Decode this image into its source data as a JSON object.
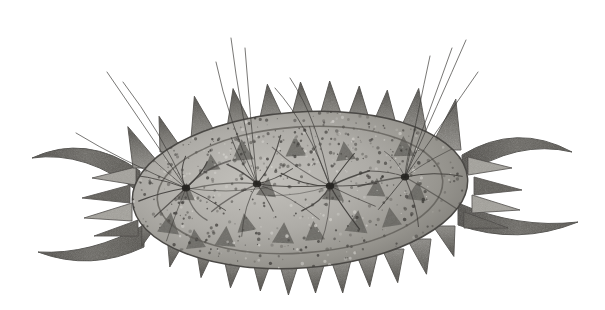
{
  "figure": {
    "domain": "Natural-Image",
    "kind": "scientific-illustration",
    "subject_label": "spiny ostracod-like microorganism, dorsal view",
    "medium": "grayscale halftone engraving / stippled lithograph",
    "caption": "",
    "background_color": "#ffffff",
    "canvas": {
      "width": 605,
      "height": 310
    }
  },
  "palette": {
    "background": "#ffffff",
    "body_light": "#b9b7b2",
    "body_mid": "#9a9892",
    "body_dark": "#6e6c67",
    "marking_dark": "#5a5853",
    "spine_light": "#a3a19b",
    "spine_dark": "#55534e",
    "horn_dark": "#5f5d58",
    "outline": "#4a4845",
    "seta_line": "#3d3b38",
    "speckle_dark": "#3a3835",
    "speckle_light": "#d6d4cf"
  },
  "body": {
    "name": "carapace",
    "shape": "ellipse",
    "center_x": 300,
    "center_y": 190,
    "radius_x": 168,
    "radius_y": 78,
    "rotation_deg": -4,
    "inner_ellipse": {
      "center_x": 300,
      "center_y": 190,
      "radius_x": 143,
      "radius_y": 63,
      "rotation_deg": -4,
      "stroke": "#5d5b56"
    }
  },
  "dorsal_spines": {
    "count": 11,
    "description": "triangular spines along the upper margin, tips pointing up and slightly left",
    "spines": [
      {
        "base_x": 148,
        "base_y": 168,
        "height": 46,
        "half_width": 15,
        "lean_deg": -26,
        "tone": "dark"
      },
      {
        "base_x": 172,
        "base_y": 152,
        "height": 38,
        "half_width": 12,
        "lean_deg": -20,
        "tone": "mid"
      },
      {
        "base_x": 205,
        "base_y": 139,
        "height": 44,
        "half_width": 14,
        "lean_deg": -14,
        "tone": "dark"
      },
      {
        "base_x": 240,
        "base_y": 128,
        "height": 40,
        "half_width": 13,
        "lean_deg": -10,
        "tone": "mid"
      },
      {
        "base_x": 272,
        "base_y": 122,
        "height": 38,
        "half_width": 13,
        "lean_deg": -7,
        "tone": "dark"
      },
      {
        "base_x": 303,
        "base_y": 118,
        "height": 36,
        "half_width": 12,
        "lean_deg": -4,
        "tone": "mid"
      },
      {
        "base_x": 331,
        "base_y": 119,
        "height": 38,
        "half_width": 12,
        "lean_deg": -2,
        "tone": "dark"
      },
      {
        "base_x": 358,
        "base_y": 122,
        "height": 36,
        "half_width": 12,
        "lean_deg": 2,
        "tone": "mid"
      },
      {
        "base_x": 384,
        "base_y": 128,
        "height": 38,
        "half_width": 13,
        "lean_deg": 5,
        "tone": "dark"
      },
      {
        "base_x": 412,
        "base_y": 136,
        "height": 48,
        "half_width": 15,
        "lean_deg": 8,
        "tone": "darker"
      },
      {
        "base_x": 445,
        "base_y": 150,
        "height": 52,
        "half_width": 16,
        "lean_deg": 12,
        "tone": "darker"
      }
    ]
  },
  "ventral_spines": {
    "count": 12,
    "description": "shorter triangular spines along the lower margin, tips pointing down",
    "spines": [
      {
        "base_x": 152,
        "base_y": 218,
        "height": 30,
        "half_width": 10,
        "lean_deg": 20,
        "tone": "mid"
      },
      {
        "base_x": 178,
        "base_y": 234,
        "height": 34,
        "half_width": 11,
        "lean_deg": 14,
        "tone": "dark"
      },
      {
        "base_x": 206,
        "base_y": 246,
        "height": 32,
        "half_width": 10,
        "lean_deg": 9,
        "tone": "mid"
      },
      {
        "base_x": 234,
        "base_y": 254,
        "height": 34,
        "half_width": 11,
        "lean_deg": 6,
        "tone": "dark"
      },
      {
        "base_x": 262,
        "base_y": 259,
        "height": 32,
        "half_width": 10,
        "lean_deg": 3,
        "tone": "mid"
      },
      {
        "base_x": 289,
        "base_y": 262,
        "height": 33,
        "half_width": 10,
        "lean_deg": 1,
        "tone": "dark"
      },
      {
        "base_x": 315,
        "base_y": 262,
        "height": 31,
        "half_width": 10,
        "lean_deg": -1,
        "tone": "mid"
      },
      {
        "base_x": 341,
        "base_y": 260,
        "height": 33,
        "half_width": 10,
        "lean_deg": -3,
        "tone": "dark"
      },
      {
        "base_x": 367,
        "base_y": 256,
        "height": 31,
        "half_width": 10,
        "lean_deg": -5,
        "tone": "mid"
      },
      {
        "base_x": 393,
        "base_y": 249,
        "height": 34,
        "half_width": 11,
        "lean_deg": -8,
        "tone": "dark"
      },
      {
        "base_x": 419,
        "base_y": 239,
        "height": 36,
        "half_width": 12,
        "lean_deg": -12,
        "tone": "darker"
      },
      {
        "base_x": 444,
        "base_y": 226,
        "height": 32,
        "half_width": 11,
        "lean_deg": -18,
        "tone": "dark"
      }
    ]
  },
  "lateral_spines": {
    "left": [
      {
        "tip_x": 92,
        "tip_y": 178,
        "base_x": 136,
        "base_y": 176,
        "half_width": 9
      },
      {
        "tip_x": 82,
        "tip_y": 198,
        "base_x": 130,
        "base_y": 194,
        "half_width": 9
      },
      {
        "tip_x": 84,
        "tip_y": 218,
        "base_x": 132,
        "base_y": 212,
        "half_width": 9
      },
      {
        "tip_x": 94,
        "tip_y": 236,
        "base_x": 138,
        "base_y": 228,
        "half_width": 8
      }
    ],
    "right": [
      {
        "tip_x": 512,
        "tip_y": 168,
        "base_x": 468,
        "base_y": 166,
        "half_width": 9
      },
      {
        "tip_x": 522,
        "tip_y": 190,
        "base_x": 474,
        "base_y": 186,
        "half_width": 9
      },
      {
        "tip_x": 520,
        "tip_y": 210,
        "base_x": 472,
        "base_y": 204,
        "half_width": 9
      },
      {
        "tip_x": 508,
        "tip_y": 228,
        "base_x": 464,
        "base_y": 220,
        "half_width": 8
      }
    ]
  },
  "horns": [
    {
      "id": "horn-upper-left",
      "side": "left",
      "description": "long scythe-shaped process curving up and to the left",
      "tip_x": 32,
      "tip_y": 158,
      "root_x": 140,
      "root_y": 182
    },
    {
      "id": "horn-lower-left",
      "side": "left",
      "description": "long blunt process extending left and slightly down",
      "tip_x": 38,
      "tip_y": 252,
      "root_x": 144,
      "root_y": 236
    },
    {
      "id": "horn-upper-right",
      "side": "right",
      "description": "long process extending right and curving slightly up",
      "tip_x": 572,
      "tip_y": 152,
      "root_x": 462,
      "root_y": 166
    },
    {
      "id": "horn-lower-right",
      "side": "right",
      "description": "long process curving down and then out to the right",
      "tip_x": 578,
      "tip_y": 222,
      "root_x": 458,
      "root_y": 214
    }
  ],
  "seta_hubs": [
    {
      "id": "hub-1",
      "x": 186,
      "y": 188,
      "ray_count": 11,
      "ray_length": 72
    },
    {
      "id": "hub-2",
      "x": 257,
      "y": 184,
      "ray_count": 10,
      "ray_length": 66
    },
    {
      "id": "hub-3",
      "x": 330,
      "y": 186,
      "ray_count": 11,
      "ray_length": 70
    },
    {
      "id": "hub-4",
      "x": 405,
      "y": 177,
      "ray_count": 9,
      "ray_length": 62
    }
  ],
  "long_setae": {
    "count": 12,
    "description": "long fine curved hair-like bristles projecting above the dorsal margin",
    "strands": [
      {
        "x1": 186,
        "y1": 188,
        "cx": 140,
        "cy": 120,
        "x2": 107,
        "y2": 72
      },
      {
        "x1": 186,
        "y1": 188,
        "cx": 160,
        "cy": 130,
        "x2": 123,
        "y2": 82
      },
      {
        "x1": 186,
        "y1": 188,
        "cx": 120,
        "cy": 160,
        "x2": 76,
        "y2": 133
      },
      {
        "x1": 257,
        "y1": 184,
        "cx": 240,
        "cy": 110,
        "x2": 231,
        "y2": 38
      },
      {
        "x1": 257,
        "y1": 184,
        "cx": 250,
        "cy": 115,
        "x2": 245,
        "y2": 48
      },
      {
        "x1": 257,
        "y1": 184,
        "cx": 228,
        "cy": 120,
        "x2": 216,
        "y2": 62
      },
      {
        "x1": 330,
        "y1": 186,
        "cx": 318,
        "cy": 120,
        "x2": 290,
        "y2": 78
      },
      {
        "x1": 330,
        "y1": 186,
        "cx": 308,
        "cy": 125,
        "x2": 275,
        "y2": 88
      },
      {
        "x1": 405,
        "y1": 177,
        "cx": 430,
        "cy": 110,
        "x2": 452,
        "y2": 48
      },
      {
        "x1": 405,
        "y1": 177,
        "cx": 418,
        "cy": 112,
        "x2": 430,
        "y2": 56
      },
      {
        "x1": 405,
        "y1": 177,
        "cx": 446,
        "cy": 118,
        "x2": 478,
        "y2": 72
      },
      {
        "x1": 405,
        "y1": 177,
        "cx": 438,
        "cy": 104,
        "x2": 466,
        "y2": 40
      }
    ]
  },
  "surface_markings": {
    "description": "dark triangular pigment patches scattered over the carapace",
    "triangles": [
      {
        "x": 168,
        "y": 233,
        "size": 22,
        "rot": 8
      },
      {
        "x": 196,
        "y": 248,
        "size": 20,
        "rot": -6
      },
      {
        "x": 225,
        "y": 246,
        "size": 21,
        "rot": 4
      },
      {
        "x": 247,
        "y": 231,
        "size": 19,
        "rot": -10
      },
      {
        "x": 283,
        "y": 243,
        "size": 22,
        "rot": 3
      },
      {
        "x": 315,
        "y": 240,
        "size": 20,
        "rot": -5
      },
      {
        "x": 356,
        "y": 232,
        "size": 23,
        "rot": 6
      },
      {
        "x": 392,
        "y": 226,
        "size": 20,
        "rot": -8
      },
      {
        "x": 186,
        "y": 200,
        "size": 18,
        "rot": 2
      },
      {
        "x": 243,
        "y": 160,
        "size": 22,
        "rot": -4
      },
      {
        "x": 266,
        "y": 196,
        "size": 20,
        "rot": 7
      },
      {
        "x": 296,
        "y": 156,
        "size": 21,
        "rot": -3
      },
      {
        "x": 333,
        "y": 200,
        "size": 22,
        "rot": 5
      },
      {
        "x": 346,
        "y": 160,
        "size": 20,
        "rot": -7
      },
      {
        "x": 376,
        "y": 196,
        "size": 19,
        "rot": 3
      },
      {
        "x": 404,
        "y": 156,
        "size": 21,
        "rot": -2
      },
      {
        "x": 416,
        "y": 200,
        "size": 20,
        "rot": 6
      },
      {
        "x": 212,
        "y": 170,
        "size": 17,
        "rot": -5
      }
    ]
  },
  "texture": {
    "speckle_count": 900,
    "description": "dense stipple / halftone speckle over the carapace, heaviest along the dorsal band"
  }
}
